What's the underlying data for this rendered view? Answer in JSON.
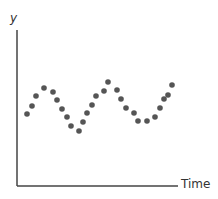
{
  "chart_data": {
    "type": "scatter",
    "title": "",
    "xlabel": "Time",
    "ylabel": "y",
    "grid": false,
    "legend": null,
    "axes_ticks": "none",
    "series": [
      {
        "name": "observations",
        "color": "#555555",
        "points_px": [
          [
            27,
            114
          ],
          [
            32,
            106
          ],
          [
            36,
            96
          ],
          [
            44,
            88
          ],
          [
            53,
            92
          ],
          [
            57,
            100
          ],
          [
            62,
            109
          ],
          [
            67,
            117
          ],
          [
            71,
            126
          ],
          [
            79,
            131
          ],
          [
            83,
            122
          ],
          [
            87,
            113
          ],
          [
            92,
            105
          ],
          [
            96,
            96
          ],
          [
            104,
            91
          ],
          [
            108,
            82
          ],
          [
            117,
            90
          ],
          [
            121,
            99
          ],
          [
            126,
            108
          ],
          [
            134,
            113
          ],
          [
            138,
            121
          ],
          [
            147,
            121
          ],
          [
            155,
            117
          ],
          [
            160,
            108
          ],
          [
            164,
            99
          ],
          [
            168,
            95
          ],
          [
            172,
            85
          ]
        ]
      }
    ],
    "axis_color": "#444444",
    "axis_px": {
      "origin": [
        17,
        186
      ],
      "y_top": [
        17,
        30
      ],
      "x_right": [
        178,
        186
      ]
    }
  }
}
